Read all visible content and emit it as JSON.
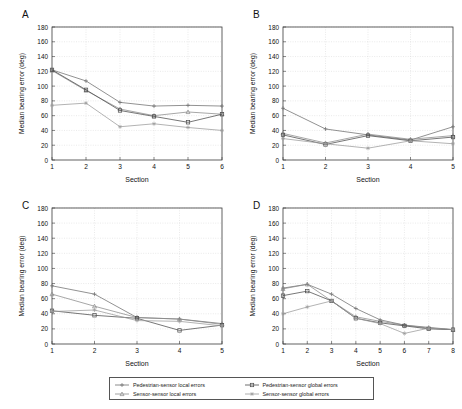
{
  "figure": {
    "background": "#ffffff",
    "axis_color": "#3a3a3a",
    "grid_color": "#c9c9c9",
    "y_axis_label": "Median bearing error (deg)",
    "x_axis_label": "Section",
    "y_ticks": [
      0,
      20,
      40,
      60,
      80,
      100,
      120,
      140,
      160,
      180
    ]
  },
  "series_styles": [
    {
      "key": "pedestrian_sensor_local",
      "color": "#6e6e6e",
      "marker": "plus"
    },
    {
      "key": "sensor_sensor_local",
      "color": "#8a8a8a",
      "marker": "triangle"
    },
    {
      "key": "pedestrian_sensor_global",
      "color": "#4a4a4a",
      "marker": "square"
    },
    {
      "key": "sensor_sensor_global",
      "color": "#9a9a9a",
      "marker": "star"
    }
  ],
  "legend": {
    "entries": [
      {
        "label": "Pedestrian-sensor local errors",
        "key": "pedestrian_sensor_local"
      },
      {
        "label": "Pedestrian-sensor global errors",
        "key": "pedestrian_sensor_global"
      },
      {
        "label": "Sensor-sensor local errors",
        "key": "sensor_sensor_local"
      },
      {
        "label": "Sensor-sensor global errors",
        "key": "sensor_sensor_global"
      }
    ]
  },
  "panels": [
    {
      "label": "A",
      "chart_ref": 0
    },
    {
      "label": "B",
      "chart_ref": 1
    },
    {
      "label": "C",
      "chart_ref": 2
    },
    {
      "label": "D",
      "chart_ref": 3
    }
  ],
  "chart_data": [
    {
      "type": "line",
      "panel": "A",
      "title": "",
      "xlabel": "Section",
      "ylabel": "Median bearing error (deg)",
      "categories": [
        1,
        2,
        3,
        4,
        5,
        6
      ],
      "xlim": [
        1,
        6
      ],
      "ylim": [
        0,
        180
      ],
      "grid": true,
      "legend": "below-figure",
      "series": [
        {
          "name": "Pedestrian-sensor local errors",
          "values": [
            122,
            107,
            78,
            73,
            74,
            73
          ]
        },
        {
          "name": "Sensor-sensor local errors",
          "values": [
            121,
            94,
            69,
            60,
            65,
            62
          ]
        },
        {
          "name": "Pedestrian-sensor global errors",
          "values": [
            122,
            95,
            67,
            59,
            51,
            62
          ]
        },
        {
          "name": "Sensor-sensor global errors",
          "values": [
            74,
            77,
            45,
            49,
            44,
            40
          ]
        }
      ]
    },
    {
      "type": "line",
      "panel": "B",
      "title": "",
      "xlabel": "Section",
      "ylabel": "Median bearing error (deg)",
      "categories": [
        1,
        2,
        3,
        4,
        5
      ],
      "xlim": [
        1,
        5
      ],
      "ylim": [
        0,
        180
      ],
      "grid": true,
      "legend": "below-figure",
      "series": [
        {
          "name": "Pedestrian-sensor local errors",
          "values": [
            70,
            42,
            34,
            27,
            45
          ]
        },
        {
          "name": "Sensor-sensor local errors",
          "values": [
            36,
            23,
            35,
            28,
            33
          ]
        },
        {
          "name": "Pedestrian-sensor global errors",
          "values": [
            34,
            21,
            33,
            26,
            31
          ]
        },
        {
          "name": "Sensor-sensor global errors",
          "values": [
            29,
            22,
            16,
            26,
            22
          ]
        }
      ]
    },
    {
      "type": "line",
      "panel": "C",
      "title": "",
      "xlabel": "Section",
      "ylabel": "Median bearing error (deg)",
      "categories": [
        1,
        2,
        3,
        4,
        5
      ],
      "xlim": [
        1,
        5
      ],
      "ylim": [
        0,
        180
      ],
      "grid": true,
      "legend": "below-figure",
      "series": [
        {
          "name": "Pedestrian-sensor local errors",
          "values": [
            77,
            66,
            35,
            33,
            27
          ]
        },
        {
          "name": "Sensor-sensor local errors",
          "values": [
            66,
            50,
            35,
            33,
            26
          ]
        },
        {
          "name": "Pedestrian-sensor global errors",
          "values": [
            44,
            38,
            34,
            18,
            25
          ]
        },
        {
          "name": "Sensor-sensor global errors",
          "values": [
            43,
            45,
            31,
            30,
            24
          ]
        }
      ]
    },
    {
      "type": "line",
      "panel": "D",
      "title": "",
      "xlabel": "Section",
      "ylabel": "Median bearing error (deg)",
      "categories": [
        1,
        2,
        3,
        4,
        5,
        6,
        7,
        8
      ],
      "xlim": [
        1,
        8
      ],
      "ylim": [
        0,
        180
      ],
      "grid": true,
      "legend": "below-figure",
      "series": [
        {
          "name": "Pedestrian-sensor local errors",
          "values": [
            74,
            79,
            66,
            47,
            32,
            25,
            22,
            19
          ]
        },
        {
          "name": "Sensor-sensor local errors",
          "values": [
            73,
            79,
            57,
            36,
            30,
            25,
            21,
            19
          ]
        },
        {
          "name": "Pedestrian-sensor global errors",
          "values": [
            64,
            70,
            57,
            34,
            28,
            24,
            20,
            19
          ]
        },
        {
          "name": "Sensor-sensor global errors",
          "values": [
            40,
            49,
            57,
            34,
            27,
            14,
            21,
            19
          ]
        }
      ]
    }
  ]
}
